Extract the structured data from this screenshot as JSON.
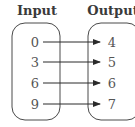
{
  "diagram": {
    "type": "mapping-diagram",
    "input_title": "Input",
    "output_title": "Output",
    "inputs": [
      "0",
      "3",
      "6",
      "9"
    ],
    "outputs": [
      "4",
      "5",
      "6",
      "7"
    ],
    "mappings": [
      {
        "from": "0",
        "to": "4"
      },
      {
        "from": "3",
        "to": "5"
      },
      {
        "from": "6",
        "to": "6"
      },
      {
        "from": "9",
        "to": "7"
      }
    ],
    "colors": {
      "stroke": "#3a3a3a",
      "text": "#555555",
      "title": "#3a3a3a"
    }
  }
}
